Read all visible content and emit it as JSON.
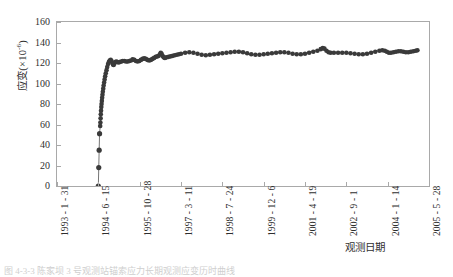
{
  "chart_data": {
    "type": "scatter",
    "title": "",
    "subtitle": "",
    "xlabel": "观测日期",
    "ylabel": "应变(×10⁻⁶)",
    "ylabel_base": "应变(×10",
    "ylabel_exp": "-6",
    "ylabel_tail": ")",
    "ylim": [
      0,
      160
    ],
    "y_ticks": [
      0,
      20,
      40,
      60,
      80,
      100,
      120,
      140,
      160
    ],
    "x_tick_labels": [
      "1993 - 1 - 31",
      "1994 - 6 - 15",
      "1995 - 10 - 28",
      "1997 - 3 - 11",
      "1998 - 7 - 24",
      "1999 - 12 - 6",
      "2001 - 4 - 19",
      "2002 - 9 - 1",
      "2004 - 1 - 14",
      "2005 - 5 - 28"
    ],
    "xlim_labels": [
      "1993 - 1 - 31",
      "2005 - 5 - 28"
    ],
    "grid": false,
    "legend": null,
    "marker": "filled-circle",
    "marker_color": "#3a3a3a",
    "series": [
      {
        "name": "应变",
        "comment": "x in fractional tick index (0 = 1993-1-31 ... 9 = 2005-5-28), y in 10^-6 strain",
        "points": [
          [
            1.0,
            0.0
          ],
          [
            1.01,
            18.0
          ],
          [
            1.02,
            35.0
          ],
          [
            1.03,
            51.0
          ],
          [
            1.045,
            58.5
          ],
          [
            1.05,
            62.0
          ],
          [
            1.055,
            66.0
          ],
          [
            1.06,
            70.0
          ],
          [
            1.065,
            73.5
          ],
          [
            1.072,
            77.0
          ],
          [
            1.078,
            80.0
          ],
          [
            1.085,
            83.0
          ],
          [
            1.092,
            86.0
          ],
          [
            1.1,
            89.0
          ],
          [
            1.108,
            92.0
          ],
          [
            1.118,
            95.0
          ],
          [
            1.128,
            98.0
          ],
          [
            1.14,
            101.0
          ],
          [
            1.152,
            104.0
          ],
          [
            1.165,
            107.0
          ],
          [
            1.18,
            110.0
          ],
          [
            1.198,
            113.0
          ],
          [
            1.215,
            116.0
          ],
          [
            1.235,
            119.0
          ],
          [
            1.255,
            121.0
          ],
          [
            1.275,
            122.5
          ],
          [
            1.3,
            123.0
          ],
          [
            1.32,
            122.0
          ],
          [
            1.34,
            120.0
          ],
          [
            1.355,
            118.5
          ],
          [
            1.37,
            118.0
          ],
          [
            1.39,
            119.5
          ],
          [
            1.41,
            121.0
          ],
          [
            1.435,
            121.5
          ],
          [
            1.46,
            121.0
          ],
          [
            1.49,
            120.5
          ],
          [
            1.52,
            121.0
          ],
          [
            1.555,
            121.5
          ],
          [
            1.59,
            122.0
          ],
          [
            1.63,
            122.0
          ],
          [
            1.67,
            121.5
          ],
          [
            1.71,
            121.5
          ],
          [
            1.75,
            122.0
          ],
          [
            1.79,
            122.5
          ],
          [
            1.83,
            123.5
          ],
          [
            1.87,
            123.0
          ],
          [
            1.91,
            122.0
          ],
          [
            1.95,
            121.5
          ],
          [
            1.99,
            122.0
          ],
          [
            2.03,
            123.0
          ],
          [
            2.07,
            124.0
          ],
          [
            2.11,
            124.5
          ],
          [
            2.15,
            124.0
          ],
          [
            2.19,
            123.0
          ],
          [
            2.23,
            122.5
          ],
          [
            2.27,
            123.0
          ],
          [
            2.31,
            124.0
          ],
          [
            2.35,
            125.0
          ],
          [
            2.39,
            126.0
          ],
          [
            2.43,
            126.5
          ],
          [
            2.46,
            127.0
          ],
          [
            2.49,
            128.5
          ],
          [
            2.51,
            130.0
          ],
          [
            2.53,
            129.0
          ],
          [
            2.555,
            127.0
          ],
          [
            2.58,
            125.5
          ],
          [
            2.61,
            125.0
          ],
          [
            2.65,
            125.5
          ],
          [
            2.7,
            126.0
          ],
          [
            2.75,
            126.5
          ],
          [
            2.8,
            127.0
          ],
          [
            2.85,
            127.5
          ],
          [
            2.9,
            128.0
          ],
          [
            2.95,
            128.5
          ],
          [
            3.0,
            129.0
          ],
          [
            3.1,
            130.0
          ],
          [
            3.2,
            130.5
          ],
          [
            3.3,
            130.0
          ],
          [
            3.4,
            129.0
          ],
          [
            3.5,
            128.0
          ],
          [
            3.6,
            127.5
          ],
          [
            3.7,
            128.0
          ],
          [
            3.8,
            128.5
          ],
          [
            3.9,
            129.0
          ],
          [
            4.0,
            129.5
          ],
          [
            4.1,
            130.0
          ],
          [
            4.2,
            130.5
          ],
          [
            4.3,
            131.0
          ],
          [
            4.4,
            131.0
          ],
          [
            4.5,
            130.5
          ],
          [
            4.6,
            129.5
          ],
          [
            4.7,
            128.5
          ],
          [
            4.8,
            128.0
          ],
          [
            4.9,
            128.0
          ],
          [
            5.0,
            128.5
          ],
          [
            5.1,
            129.0
          ],
          [
            5.2,
            129.5
          ],
          [
            5.3,
            130.0
          ],
          [
            5.4,
            130.5
          ],
          [
            5.5,
            130.5
          ],
          [
            5.6,
            130.0
          ],
          [
            5.7,
            129.0
          ],
          [
            5.8,
            128.5
          ],
          [
            5.9,
            128.5
          ],
          [
            6.0,
            129.0
          ],
          [
            6.1,
            130.0
          ],
          [
            6.2,
            131.0
          ],
          [
            6.3,
            132.0
          ],
          [
            6.38,
            133.5
          ],
          [
            6.43,
            134.5
          ],
          [
            6.47,
            134.0
          ],
          [
            6.52,
            132.0
          ],
          [
            6.57,
            130.5
          ],
          [
            6.62,
            130.0
          ],
          [
            6.7,
            130.0
          ],
          [
            6.8,
            130.0
          ],
          [
            6.9,
            130.0
          ],
          [
            7.0,
            130.0
          ],
          [
            7.1,
            129.5
          ],
          [
            7.2,
            129.0
          ],
          [
            7.3,
            128.5
          ],
          [
            7.4,
            128.5
          ],
          [
            7.5,
            129.0
          ],
          [
            7.6,
            130.0
          ],
          [
            7.7,
            131.0
          ],
          [
            7.8,
            132.0
          ],
          [
            7.87,
            132.5
          ],
          [
            7.93,
            132.0
          ],
          [
            7.98,
            131.0
          ],
          [
            8.03,
            130.0
          ],
          [
            8.08,
            130.0
          ],
          [
            8.14,
            130.5
          ],
          [
            8.2,
            131.0
          ],
          [
            8.26,
            131.5
          ],
          [
            8.32,
            131.5
          ],
          [
            8.38,
            131.0
          ],
          [
            8.44,
            130.5
          ],
          [
            8.5,
            130.5
          ],
          [
            8.56,
            131.0
          ],
          [
            8.62,
            131.5
          ],
          [
            8.68,
            132.0
          ],
          [
            8.72,
            132.5
          ]
        ]
      }
    ]
  },
  "caption": {
    "text": "图 4-3-3  陈家坝 3 号观测站锚索应力长期观测应变历时曲线"
  }
}
